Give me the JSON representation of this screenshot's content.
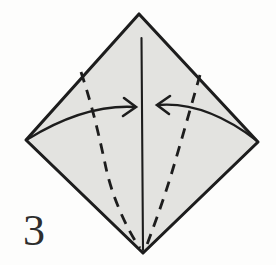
{
  "figure": {
    "step_label": "3",
    "colors": {
      "background": "#fdfdfc",
      "paper": "#e3e3e0",
      "ink": "#1d1d1d",
      "label": "#2e2e2e"
    },
    "diagram": {
      "type": "origami-step",
      "canvas": {
        "width": 276,
        "height": 265
      },
      "paper_outline_points": "139,14 258,142 143,253 26,140",
      "center_crease_d": "M 141.5 38 L 143 250",
      "left_fold_line_d": "M 81 72 C 93 108, 100 140, 106 168 C 112 196, 126 228, 140 248",
      "right_fold_line_d": "M 200 75 C 190 110, 181 142, 172 172 C 163 202, 152 231, 145 250",
      "left_arrow_shaft_d": "M 28 139 Q 85 104, 135 107",
      "left_arrow_head_points": "124,98 136,107 123,116",
      "right_arrow_shaft_d": "M 256 140 Q 205 101, 158 105",
      "right_arrow_head_points": "170,96 157,105 169,114"
    }
  }
}
